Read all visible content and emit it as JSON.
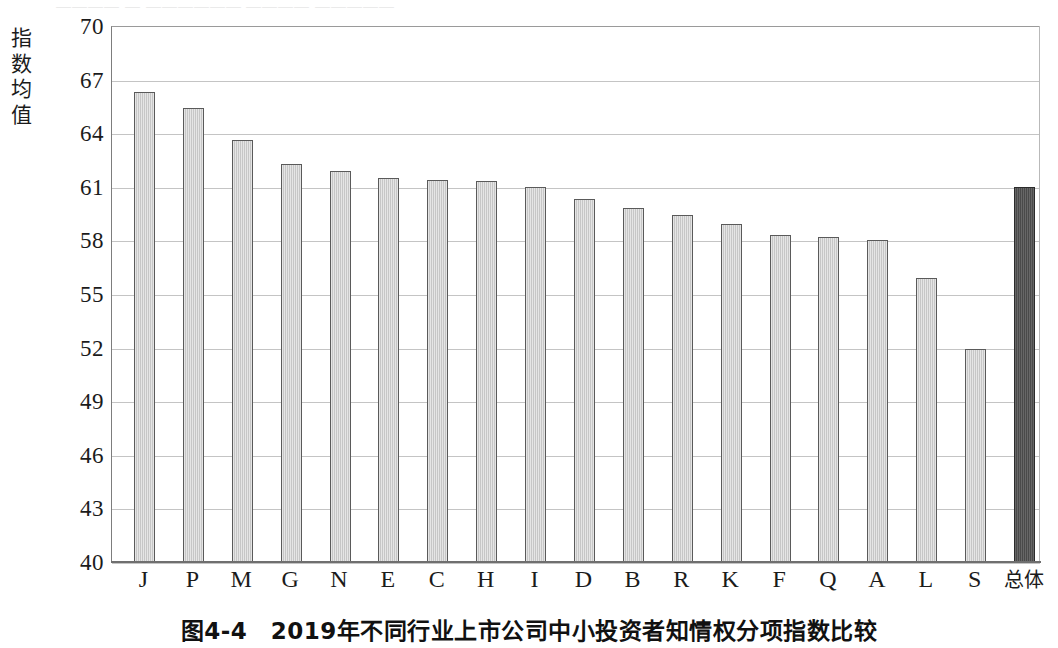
{
  "figure": {
    "caption": "图4-4　2019年不同行业上市公司中小投资者知情权分项指数比较",
    "y_axis_title_chars": [
      "指",
      "数",
      "均",
      "值"
    ],
    "top_cut_text": "＿＿＿＿ ＿ ＿＿＿＿＿＿ ＿＿＿＿ ＿＿＿＿＿"
  },
  "chart_data": {
    "type": "bar",
    "title": "图4-4　2019年不同行业上市公司中小投资者知情权分项指数比较",
    "xlabel": "",
    "ylabel": "指数均值",
    "ylim": [
      40,
      70
    ],
    "yticks": [
      70,
      67,
      64,
      61,
      58,
      55,
      52,
      49,
      46,
      43,
      40
    ],
    "grid": true,
    "legend": "none",
    "categories": [
      "J",
      "P",
      "M",
      "G",
      "N",
      "E",
      "C",
      "H",
      "I",
      "D",
      "B",
      "R",
      "K",
      "F",
      "Q",
      "A",
      "L",
      "S",
      "总体"
    ],
    "values": [
      66.3,
      65.4,
      63.6,
      62.3,
      61.9,
      61.5,
      61.4,
      61.3,
      61.0,
      60.3,
      59.8,
      59.4,
      58.9,
      58.3,
      58.2,
      58.0,
      55.9,
      51.9,
      61.0
    ],
    "highlight_index": 18,
    "colors": {
      "bar_fill": "#c6c6c6",
      "bar_border": "#5a5a5a",
      "total_bar_fill": "#4a4a4a",
      "total_bar_border": "#2b2b2b",
      "gridline": "#c4c4c4",
      "axis": "#6f6f6f",
      "text": "#1b1b1b"
    }
  }
}
